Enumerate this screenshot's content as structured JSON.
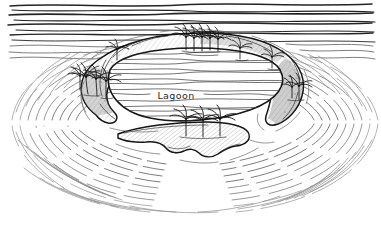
{
  "figure": {
    "kind": "pen-and-ink-illustration",
    "background_color": "#ffffff",
    "ink_color": "#1a1a1a",
    "wave_color": "#4a4a4a",
    "faint_wave_color": "#8a8a8a",
    "width": 381,
    "height": 241
  },
  "labels": {
    "lagoon": "Lagoon"
  },
  "regions": {
    "open_ocean": "open-ocean",
    "wave_rings": "concentric-wave-rings",
    "atoll_rim": "atoll-reef-rim",
    "lagoon_water": "lagoon-water",
    "south_islet": "southern-islet"
  },
  "palm_groups": [
    {
      "name": "west-rim-palms",
      "count": 4,
      "cx": 96,
      "cy": 86
    },
    {
      "name": "north-rim-palms",
      "count": 5,
      "cx": 198,
      "cy": 45
    },
    {
      "name": "northwest-rim-palm",
      "count": 1,
      "cx": 117,
      "cy": 53
    },
    {
      "name": "northeast-rim-palm",
      "count": 1,
      "cx": 240,
      "cy": 57
    },
    {
      "name": "east-rim-palm",
      "count": 1,
      "cx": 272,
      "cy": 66
    },
    {
      "name": "east-tip-palm",
      "count": 1,
      "cx": 299,
      "cy": 88
    },
    {
      "name": "south-islet-palms",
      "count": 3,
      "cx": 203,
      "cy": 131
    }
  ]
}
